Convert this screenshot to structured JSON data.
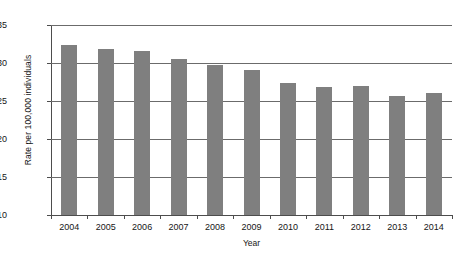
{
  "chart_data": {
    "type": "bar",
    "title": "",
    "xlabel": "Year",
    "ylabel": "Rate per 100,000 individuals",
    "categories": [
      "2004",
      "2005",
      "2006",
      "2007",
      "2008",
      "2009",
      "2010",
      "2011",
      "2012",
      "2013",
      "2014"
    ],
    "values": [
      32.4,
      31.8,
      31.6,
      30.5,
      29.7,
      29.1,
      27.4,
      26.9,
      27.0,
      25.6,
      26.0
    ],
    "ylim": [
      10,
      35
    ],
    "yticks": [
      10,
      15,
      20,
      25,
      30,
      35
    ],
    "ytick_labels": [
      "10",
      "15",
      "20",
      "25",
      "30",
      "35"
    ],
    "grid": true,
    "legend": false,
    "bar_color": "#7f7f7f",
    "axis_color": "#4d4d4d",
    "gridline_color": "#6b6b6b"
  }
}
